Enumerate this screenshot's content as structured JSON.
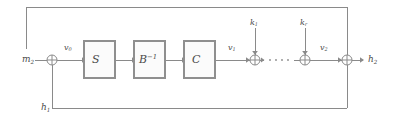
{
  "diagram": {
    "canvas": {
      "width": 393,
      "height": 120,
      "background": "#ffffff"
    },
    "colors": {
      "wire": "#8a8a8a",
      "block_stroke": "#8f8f8f",
      "block_fill": "#fbfbfb",
      "text": "#4a4a4a"
    },
    "blocks": [
      {
        "id": "block-s",
        "label_main": "S",
        "label_sup": "",
        "x": 84,
        "y": 41,
        "w": 31,
        "h": 37
      },
      {
        "id": "block-b-inv",
        "label_main": "B",
        "label_sup": "−1",
        "x": 134,
        "y": 41,
        "w": 31,
        "h": 37
      },
      {
        "id": "block-c",
        "label_main": "C",
        "label_sup": "",
        "x": 184,
        "y": 41,
        "w": 31,
        "h": 37
      }
    ],
    "gates": [
      {
        "id": "xor-input",
        "cx": 52,
        "cy": 60,
        "r": 5
      },
      {
        "id": "xor-k1",
        "cx": 255,
        "cy": 60,
        "r": 5
      },
      {
        "id": "xor-kr",
        "cx": 305,
        "cy": 60,
        "r": 5
      },
      {
        "id": "xor-output",
        "cx": 347,
        "cy": 60,
        "r": 5
      }
    ],
    "labels": {
      "input_message": {
        "main": "m",
        "sub": "2",
        "x": 22,
        "y": 55
      },
      "chaining_in": {
        "main": "h",
        "sub": "1",
        "x": 41,
        "y": 103
      },
      "v0": {
        "main": "v",
        "sub": "0",
        "x": 64,
        "y": 44
      },
      "v1": {
        "main": "v",
        "sub": "1",
        "x": 228,
        "y": 44
      },
      "v2": {
        "main": "v",
        "sub": "2",
        "x": 320,
        "y": 44
      },
      "k1": {
        "main": "k",
        "sub": "1",
        "x": 250,
        "y": 22
      },
      "kr": {
        "main": "k",
        "sub": "r",
        "x": 300,
        "y": 22
      },
      "output_hash": {
        "main": "h",
        "sub": "2",
        "x": 368,
        "y": 55
      }
    },
    "ellipsis": {
      "x_start": 266,
      "x_end": 293,
      "y": 60,
      "dots": 4
    },
    "feedback": {
      "top_path": "M 26 7 L 347 7 L 347 55",
      "bottom_path": "M 52 65 L 52 108 L 347 108 L 347 65",
      "left_drop_path": "M 26 7 L 26 49"
    }
  }
}
